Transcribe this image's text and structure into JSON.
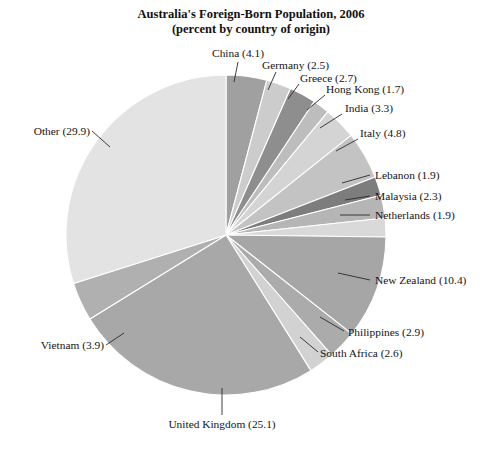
{
  "chart_data": {
    "type": "pie",
    "title": "Australia's Foreign-Born Population, 2006",
    "subtitle": "(percent by country of origin)",
    "xlabel": "",
    "ylabel": "",
    "units": "percent",
    "legend": "none (direct labels with leader lines)",
    "grid": false,
    "start_angle_deg": 0,
    "direction": "clockwise",
    "categories": [
      "China",
      "Germany",
      "Greece",
      "Hong Kong",
      "India",
      "Italy",
      "Lebanon",
      "Malaysia",
      "Netherlands",
      "New Zealand",
      "Philippines",
      "South Africa",
      "United Kingdom",
      "Vietnam",
      "Other"
    ],
    "values": [
      4.1,
      2.5,
      2.7,
      1.7,
      3.3,
      4.8,
      1.9,
      2.3,
      1.9,
      10.4,
      2.9,
      2.6,
      25.1,
      3.9,
      29.9
    ],
    "total": 100.0,
    "slice_colors": [
      "#a0a0a0",
      "#cccccc",
      "#8e8e8e",
      "#bdbdbd",
      "#d4d4d4",
      "#c3c3c3",
      "#7d7d7d",
      "#b5b5b5",
      "#d9d9d9",
      "#a6a6a6",
      "#ababab",
      "#d2d2d2",
      "#a8a8a8",
      "#b0b0b0",
      "#e3e3e3"
    ],
    "slices": [
      {
        "label": "China (4.1)",
        "name": "China",
        "value": 4.1,
        "color": "#a0a0a0"
      },
      {
        "label": "Germany (2.5)",
        "name": "Germany",
        "value": 2.5,
        "color": "#cccccc"
      },
      {
        "label": "Greece (2.7)",
        "name": "Greece",
        "value": 2.7,
        "color": "#8e8e8e"
      },
      {
        "label": "Hong Kong (1.7)",
        "name": "Hong Kong",
        "value": 1.7,
        "color": "#bdbdbd"
      },
      {
        "label": "India (3.3)",
        "name": "India",
        "value": 3.3,
        "color": "#d4d4d4"
      },
      {
        "label": "Italy (4.8)",
        "name": "Italy",
        "value": 4.8,
        "color": "#c3c3c3"
      },
      {
        "label": "Lebanon (1.9)",
        "name": "Lebanon",
        "value": 1.9,
        "color": "#7d7d7d"
      },
      {
        "label": "Malaysia (2.3)",
        "name": "Malaysia",
        "value": 2.3,
        "color": "#b5b5b5"
      },
      {
        "label": "Netherlands (1.9)",
        "name": "Netherlands",
        "value": 1.9,
        "color": "#d9d9d9"
      },
      {
        "label": "New Zealand (10.4)",
        "name": "New Zealand",
        "value": 10.4,
        "color": "#a6a6a6"
      },
      {
        "label": "Philippines (2.9)",
        "name": "Philippines",
        "value": 2.9,
        "color": "#ababab"
      },
      {
        "label": "South Africa (2.6)",
        "name": "South Africa",
        "value": 2.6,
        "color": "#d2d2d2"
      },
      {
        "label": "United Kingdom (25.1)",
        "name": "United Kingdom",
        "value": 25.1,
        "color": "#a8a8a8"
      },
      {
        "label": "Vietnam (3.9)",
        "name": "Vietnam",
        "value": 3.9,
        "color": "#b0b0b0"
      },
      {
        "label": "Other (29.9)",
        "name": "Other",
        "value": 29.9,
        "color": "#e3e3e3"
      }
    ]
  },
  "labels": {
    "china": "China (4.1)",
    "germany": "Germany (2.5)",
    "greece": "Greece (2.7)",
    "hong_kong": "Hong Kong (1.7)",
    "india": "India (3.3)",
    "italy": "Italy (4.8)",
    "lebanon": "Lebanon (1.9)",
    "malaysia": "Malaysia (2.3)",
    "netherlands": "Netherlands (1.9)",
    "new_zealand": "New Zealand (10.4)",
    "philippines": "Philippines (2.9)",
    "south_africa": "South Africa (2.6)",
    "united_kingdom": "United Kingdom (25.1)",
    "vietnam": "Vietnam (3.9)",
    "other": "Other (29.9)"
  },
  "title": {
    "line1": "Australia's Foreign-Born Population, 2006",
    "line2": "(percent by country of origin)"
  }
}
